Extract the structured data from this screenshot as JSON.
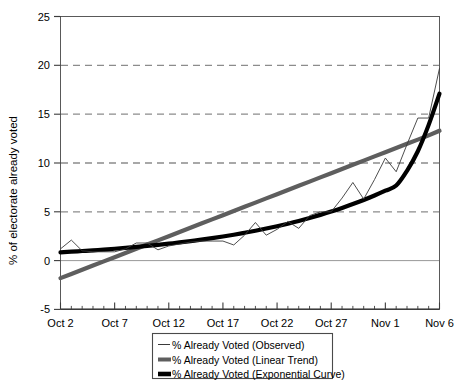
{
  "chart_data": {
    "type": "line",
    "title": "",
    "xlabel": "",
    "ylabel": "% of electorate already voted",
    "ylim": [
      -5,
      25
    ],
    "yticks": [
      -5,
      0,
      5,
      10,
      15,
      20,
      25
    ],
    "ytick_labels": [
      "-5",
      "0",
      "5",
      "10",
      "15",
      "20",
      "25"
    ],
    "grid": "horizontal dashed gridlines at 5, 10, 15, 20; solid line at 0",
    "legend_position": "below plot, centered",
    "x": [
      "Oct 2",
      "Oct 3",
      "Oct 4",
      "Oct 5",
      "Oct 6",
      "Oct 7",
      "Oct 8",
      "Oct 9",
      "Oct 10",
      "Oct 11",
      "Oct 12",
      "Oct 13",
      "Oct 14",
      "Oct 15",
      "Oct 16",
      "Oct 17",
      "Oct 18",
      "Oct 19",
      "Oct 20",
      "Oct 21",
      "Oct 22",
      "Oct 23",
      "Oct 24",
      "Oct 25",
      "Oct 26",
      "Oct 27",
      "Oct 28",
      "Oct 29",
      "Oct 30",
      "Oct 31",
      "Nov 1",
      "Nov 2",
      "Nov 3",
      "Nov 4",
      "Nov 5",
      "Nov 6"
    ],
    "xtick_labels": [
      "Oct 2",
      "Oct 7",
      "Oct 12",
      "Oct 17",
      "Oct 22",
      "Oct 27",
      "Nov 1",
      "Nov 6"
    ],
    "xtick_indices": [
      0,
      5,
      10,
      15,
      20,
      25,
      30,
      35
    ],
    "series": [
      {
        "name": "% Already Voted (Observed)",
        "style": "thin",
        "color": "#3a3a3a",
        "values": [
          1.2,
          2.1,
          1.0,
          0.9,
          0.9,
          0.9,
          1.2,
          1.8,
          1.8,
          1.1,
          1.5,
          1.7,
          1.9,
          2.0,
          2.0,
          2.0,
          1.6,
          2.6,
          3.9,
          2.6,
          3.2,
          4.0,
          3.3,
          4.6,
          5.0,
          5.0,
          6.4,
          8.0,
          6.3,
          8.3,
          10.5,
          9.1,
          11.9,
          14.6,
          14.6,
          19.7
        ]
      },
      {
        "name": "% Already Voted (Linear Trend)",
        "style": "thick",
        "color": "#5e5e5e",
        "values": [
          -1.8,
          -1.37,
          -0.94,
          -0.51,
          -0.08,
          0.35,
          0.78,
          1.21,
          1.64,
          2.07,
          2.5,
          2.93,
          3.36,
          3.79,
          4.22,
          4.65,
          5.08,
          5.51,
          5.94,
          6.37,
          6.8,
          7.23,
          7.66,
          8.09,
          8.52,
          8.95,
          9.38,
          9.81,
          10.24,
          10.67,
          11.1,
          11.53,
          11.96,
          12.39,
          12.82,
          13.3
        ]
      },
      {
        "name": "% Already Voted (Exponential Curve)",
        "style": "thick",
        "color": "#000000",
        "values": [
          0.85,
          0.91,
          0.98,
          1.05,
          1.13,
          1.21,
          1.3,
          1.4,
          1.5,
          1.61,
          1.73,
          1.86,
          2.0,
          2.14,
          2.3,
          2.47,
          2.65,
          2.85,
          3.06,
          3.28,
          3.52,
          3.78,
          4.06,
          4.36,
          4.68,
          5.02,
          5.39,
          5.79,
          6.21,
          6.67,
          7.16,
          7.69,
          9.2,
          11.2,
          13.9,
          17.1
        ]
      }
    ]
  },
  "legend": {
    "entries": [
      {
        "label": "% Already Voted (Observed)",
        "marker": "thin-line-swatch"
      },
      {
        "label": "% Already Voted (Linear Trend)",
        "marker": "thick-gray-line-swatch"
      },
      {
        "label": "% Already Voted (Exponential Curve)",
        "marker": "thick-black-line-swatch"
      }
    ]
  },
  "axis": {
    "y_title": "% of electorate already voted"
  },
  "colors": {
    "observed": "#3a3a3a",
    "linear": "#5e5e5e",
    "exponential": "#000000",
    "grid": "#8c8c8c",
    "frame": "#595959",
    "background": "#ffffff"
  }
}
